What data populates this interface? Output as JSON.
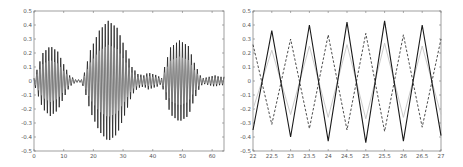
{
  "chart_data": [
    {
      "id": "left",
      "type": "line",
      "title": "",
      "xlabel": "",
      "ylabel": "",
      "xlim": [
        0,
        64
      ],
      "ylim": [
        -0.5,
        0.5
      ],
      "grid": false,
      "legend": null,
      "xticks": [
        0,
        10,
        20,
        30,
        40,
        50,
        60
      ],
      "xtick_labels": [
        "0",
        "10",
        "20",
        "30",
        "40",
        "50",
        "60"
      ],
      "yticks": [
        -0.5,
        -0.4,
        -0.3,
        -0.2,
        -0.1,
        0,
        0.1,
        0.2,
        0.3,
        0.4,
        0.5
      ],
      "ytick_labels": [
        "-0.5",
        "-0.4",
        "-0.3",
        "-0.2",
        "-0.1",
        "0",
        "0.1",
        "0.2",
        "0.3",
        "0.4",
        "0.5"
      ],
      "frame": {
        "x0": 34,
        "y0": 11,
        "x1": 224,
        "y1": 151
      },
      "carrier_period": 1.0,
      "series": [
        {
          "name": "oscillating signal",
          "style": "solid",
          "color": "#222222",
          "description": "fast oscillation (period ~1) modulated by burst envelope",
          "envelope": {
            "x": [
              0,
              1,
              3,
              5.5,
              8,
              10,
              12,
              14,
              16,
              17,
              19,
              22,
              25,
              28,
              31,
              33,
              35,
              37,
              38.5,
              40,
              41.5,
              43,
              44,
              46,
              49,
              52,
              54,
              56,
              57,
              59,
              61,
              62.5,
              64
            ],
            "y": [
              0.02,
              0.08,
              0.2,
              0.25,
              0.21,
              0.12,
              0.04,
              0.01,
              0.01,
              0.06,
              0.22,
              0.36,
              0.43,
              0.38,
              0.22,
              0.1,
              0.05,
              0.04,
              0.06,
              0.05,
              0.04,
              0.02,
              0.1,
              0.24,
              0.29,
              0.25,
              0.13,
              0.04,
              0.02,
              0.03,
              0.04,
              0.03,
              0.03
            ]
          }
        },
        {
          "name": "inner gray trace",
          "style": "solid",
          "color": "#9a9a9a",
          "description": "same-phase smaller oscillation, ~0.6 of main amplitude",
          "scale": 0.6
        }
      ]
    },
    {
      "id": "right",
      "type": "line",
      "title": "",
      "xlabel": "",
      "ylabel": "",
      "xlim": [
        22,
        27
      ],
      "ylim": [
        -0.5,
        0.5
      ],
      "grid": false,
      "legend": null,
      "xticks": [
        22,
        22.5,
        23,
        23.5,
        24,
        24.5,
        25,
        25.5,
        26,
        26.5,
        27
      ],
      "xtick_labels": [
        "22",
        "22.5",
        "23",
        "23.5",
        "24",
        "24.5",
        "25",
        "25.5",
        "26",
        "26.5",
        "27"
      ],
      "yticks": [
        -0.5,
        -0.4,
        -0.3,
        -0.2,
        -0.1,
        0,
        0.1,
        0.2,
        0.3,
        0.4,
        0.5
      ],
      "ytick_labels": [
        "-0.5",
        "-0.4",
        "-0.3",
        "-0.2",
        "-0.1",
        "0",
        "0.1",
        "0.2",
        "0.3",
        "0.4",
        "0.5"
      ],
      "frame": {
        "x0": 253,
        "y0": 11,
        "x1": 441,
        "y1": 151
      },
      "series": [
        {
          "name": "solid black",
          "style": "solid",
          "color": "#1a1a1a",
          "x": [
            22,
            22.5,
            23,
            23.5,
            24,
            24.5,
            25,
            25.5,
            26,
            26.5,
            27
          ],
          "y": [
            -0.35,
            0.36,
            -0.4,
            0.4,
            -0.43,
            0.42,
            -0.44,
            0.43,
            -0.43,
            0.4,
            -0.39
          ]
        },
        {
          "name": "dashed",
          "style": "dashed",
          "color": "#3a3a3a",
          "x": [
            22,
            22.5,
            23,
            23.5,
            24,
            24.5,
            25,
            25.5,
            26,
            26.5,
            27
          ],
          "y": [
            0.26,
            -0.31,
            0.3,
            -0.34,
            0.33,
            -0.35,
            0.34,
            -0.36,
            0.33,
            -0.33,
            0.3
          ]
        },
        {
          "name": "light gray",
          "style": "solid",
          "color": "#c4c4c4",
          "x": [
            22,
            22.5,
            23,
            23.5,
            24,
            24.5,
            25,
            25.5,
            26,
            26.5,
            27
          ],
          "y": [
            -0.2,
            0.22,
            -0.24,
            0.25,
            -0.26,
            0.26,
            -0.27,
            0.27,
            -0.26,
            0.25,
            -0.24
          ]
        }
      ]
    }
  ]
}
